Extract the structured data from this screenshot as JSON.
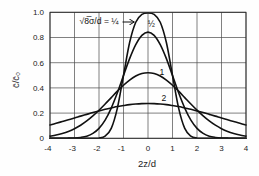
{
  "chart_data": {
    "type": "line",
    "title": "",
    "xlabel": "2z/d",
    "ylabel": "c̄/c̄₀",
    "xlim": [
      -4,
      4
    ],
    "ylim": [
      0,
      1.0
    ],
    "grid": true,
    "legend": "none (curves labeled inline)",
    "x_ticks": [
      -4,
      -3,
      -2,
      -1,
      0,
      1,
      2,
      3,
      4
    ],
    "x_tick_labels": [
      "-4",
      "-3",
      "-2",
      "-1",
      "0",
      "1",
      "2",
      "3",
      "4"
    ],
    "y_ticks": [
      0,
      0.2,
      0.4,
      0.6,
      0.8,
      1.0
    ],
    "y_tick_labels": [
      "0",
      "0.2",
      "0.4",
      "0.6",
      "0.8",
      "1.0"
    ],
    "x": [
      -4,
      -3.75,
      -3.5,
      -3.25,
      -3,
      -2.75,
      -2.5,
      -2.25,
      -2,
      -1.75,
      -1.5,
      -1.25,
      -1,
      -0.75,
      -0.5,
      -0.25,
      0,
      0.25,
      0.5,
      0.75,
      1,
      1.25,
      1.5,
      1.75,
      2,
      2.25,
      2.5,
      2.75,
      3,
      3.25,
      3.5,
      3.75,
      4
    ],
    "series": [
      {
        "name": "√8σ/d = 1/4",
        "param": 0.25,
        "values": [
          0,
          0,
          0,
          0,
          0,
          0,
          0,
          0,
          0.002,
          0.017,
          0.079,
          0.24,
          0.5,
          0.76,
          0.921,
          0.983,
          0.995,
          0.983,
          0.921,
          0.76,
          0.5,
          0.24,
          0.079,
          0.017,
          0.002,
          0,
          0,
          0,
          0,
          0,
          0,
          0,
          0
        ]
      },
      {
        "name": "√8σ/d = 1/2",
        "param": 0.5,
        "values": [
          0,
          0,
          0,
          0.001,
          0.002,
          0.007,
          0.017,
          0.039,
          0.079,
          0.144,
          0.24,
          0.361,
          0.498,
          0.632,
          0.743,
          0.817,
          0.843,
          0.817,
          0.743,
          0.632,
          0.498,
          0.361,
          0.24,
          0.144,
          0.079,
          0.039,
          0.017,
          0.007,
          0.002,
          0.001,
          0,
          0,
          0
        ]
      },
      {
        "name": "√8σ/d = 1",
        "param": 1,
        "values": [
          0.017,
          0.026,
          0.038,
          0.054,
          0.076,
          0.104,
          0.138,
          0.178,
          0.223,
          0.272,
          0.323,
          0.374,
          0.421,
          0.462,
          0.494,
          0.514,
          0.52,
          0.514,
          0.494,
          0.462,
          0.421,
          0.374,
          0.323,
          0.272,
          0.223,
          0.178,
          0.138,
          0.104,
          0.076,
          0.054,
          0.038,
          0.026,
          0.017
        ]
      },
      {
        "name": "√8σ/d = 2",
        "param": 2,
        "values": [
          0.106,
          0.119,
          0.133,
          0.147,
          0.161,
          0.176,
          0.19,
          0.204,
          0.217,
          0.23,
          0.241,
          0.252,
          0.26,
          0.267,
          0.272,
          0.275,
          0.276,
          0.275,
          0.272,
          0.267,
          0.26,
          0.252,
          0.241,
          0.23,
          0.217,
          0.204,
          0.19,
          0.176,
          0.161,
          0.147,
          0.133,
          0.119,
          0.106
        ]
      }
    ],
    "annotations": [
      {
        "series": 0,
        "text": "√8̅σ/d = ¼",
        "x": -2.0,
        "y": 0.927,
        "arrow_from": [
          -1.04,
          0.923
        ],
        "arrow_to": [
          -0.56,
          0.923
        ]
      },
      {
        "series": 1,
        "text": "½",
        "x": 0.14,
        "y": 0.907
      },
      {
        "series": 2,
        "text": "1",
        "x": 0.57,
        "y": 0.526
      },
      {
        "series": 3,
        "text": "2",
        "x": 0.65,
        "y": 0.32
      }
    ]
  }
}
